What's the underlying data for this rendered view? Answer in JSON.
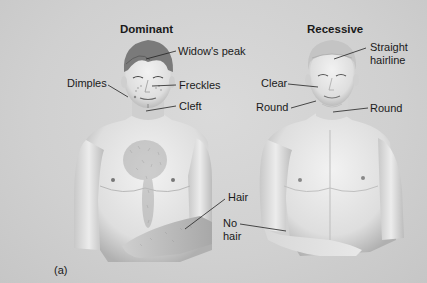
{
  "figure": {
    "panel_label": "(a)",
    "dominant": {
      "heading": "Dominant",
      "labels": {
        "widows_peak": "Widow's peak",
        "dimples": "Dimples",
        "freckles": "Freckles",
        "cleft": "Cleft",
        "hair": "Hair"
      }
    },
    "recessive": {
      "heading": "Recessive",
      "labels": {
        "straight_hairline_1": "Straight",
        "straight_hairline_2": "hairline",
        "clear": "Clear",
        "round_cheek": "Round",
        "round_chin": "Round",
        "no_hair_1": "No",
        "no_hair_2": "hair"
      }
    }
  },
  "colors": {
    "background": "#d2d2d2",
    "skin_light": "#ececec",
    "skin_shade": "#b4b4b4",
    "hair_dark": "#7a7a7a",
    "hair_light": "#c4c4c4",
    "text": "#1a1a1a"
  }
}
